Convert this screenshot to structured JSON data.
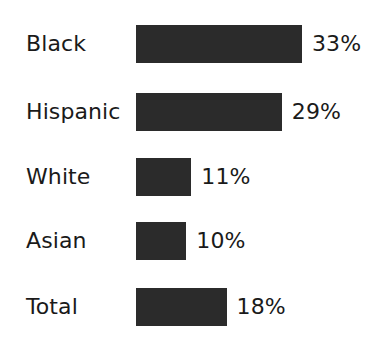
{
  "chart_data": {
    "type": "bar",
    "orientation": "horizontal",
    "title": "",
    "subtitle": "",
    "xlabel": "",
    "ylabel": "",
    "categories": [
      "Black",
      "Hispanic",
      "White",
      "Asian",
      "Total"
    ],
    "values": [
      33,
      29,
      11,
      10,
      18
    ],
    "value_labels": [
      "33%",
      "29%",
      "11%",
      "10%",
      "18%"
    ],
    "units": "percent",
    "xlim": [
      0,
      33
    ],
    "grid": false,
    "legend": false,
    "axes_visible": false,
    "tick_labels": [],
    "annotations": [],
    "colors": {
      "bar_fill": "#2b2b2b",
      "text": "#1a1a1a",
      "background": "#ffffff"
    }
  },
  "layout": {
    "bar_origin_x": 136,
    "bar_height": 38,
    "row_pitch": 65,
    "first_row_top": 25,
    "px_per_unit": 5.03,
    "value_gap": 10
  }
}
